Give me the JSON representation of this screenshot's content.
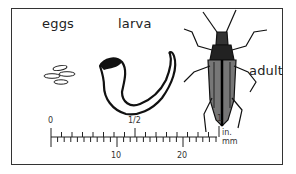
{
  "labels": {
    "eggs": "eggs",
    "larva": "larva",
    "adult": "adult"
  },
  "scale": {
    "inch_labels": [
      "0",
      "1/2",
      "1"
    ],
    "mm_labels": [
      "10",
      "20"
    ],
    "unit_inches": "in.",
    "unit_mm": "mm"
  }
}
